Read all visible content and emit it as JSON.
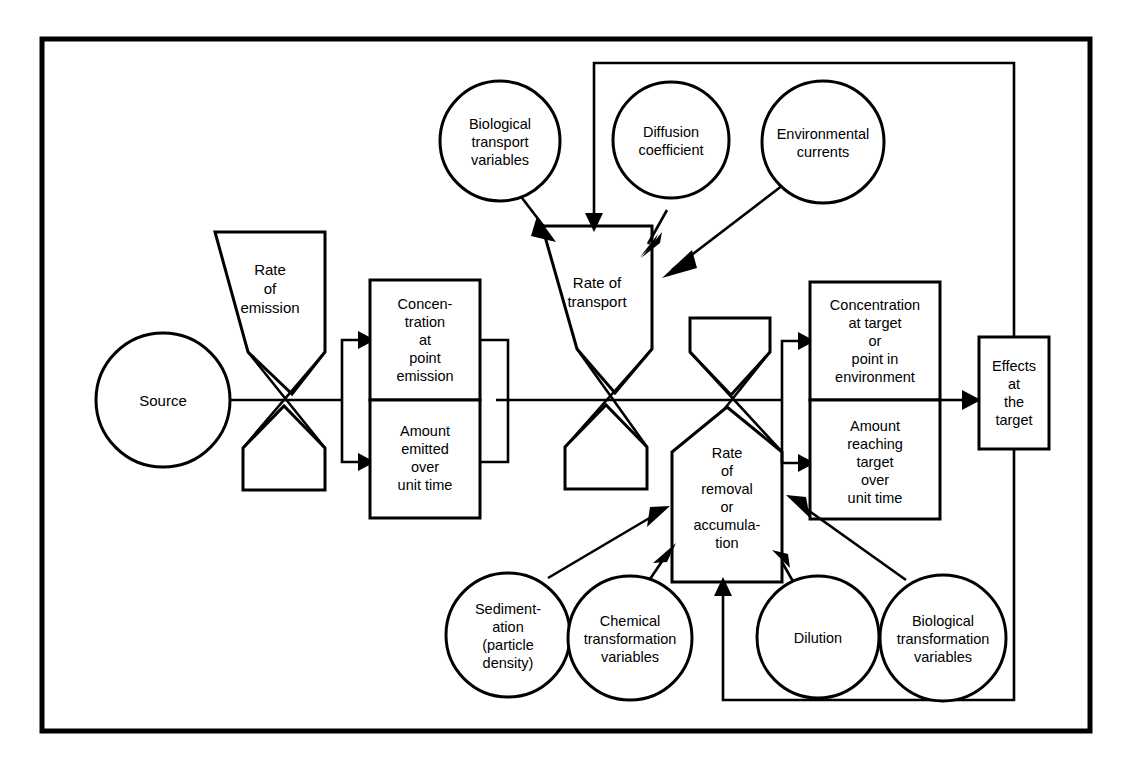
{
  "diagram": {
    "background_color": "#ffffff",
    "line_color": "#000000",
    "frame": {
      "x": 42,
      "y": 39,
      "width": 1048,
      "height": 692
    },
    "nodes": [
      {
        "id": "source",
        "shape": "circle",
        "label": "Source",
        "cx": 163,
        "cy": 400,
        "r": 67
      },
      {
        "id": "rate-of-emission",
        "shape": "pentagon-down",
        "label": "Rate\nof\nemission",
        "x": 215,
        "y": 232,
        "width": 110,
        "height": 162
      },
      {
        "id": "emission-blank",
        "shape": "pentagon-up",
        "label": "",
        "x": 243,
        "y": 406,
        "width": 82,
        "height": 84
      },
      {
        "id": "concentration-point",
        "shape": "rect",
        "label": "Concen-\ntration\nat\npoint\nemission",
        "x": 370,
        "y": 280,
        "width": 110,
        "height": 120
      },
      {
        "id": "amount-emitted",
        "shape": "rect",
        "label": "Amount\nemitted\nover\nunit time",
        "x": 370,
        "y": 400,
        "width": 110,
        "height": 118
      },
      {
        "id": "biological-transport",
        "shape": "circle",
        "label": "Biological\ntransport\nvariables",
        "cx": 500,
        "cy": 141,
        "r": 60
      },
      {
        "id": "diffusion-coefficient",
        "shape": "circle",
        "label": "Diffusion\ncoefficient",
        "cx": 671,
        "cy": 140,
        "r": 58
      },
      {
        "id": "environmental-currents",
        "shape": "circle",
        "label": "Environmental\ncurrents",
        "cx": 823,
        "cy": 142,
        "r": 61
      },
      {
        "id": "rate-of-transport",
        "shape": "pentagon-down",
        "label": "Rate of\ntransport",
        "x": 542,
        "y": 226,
        "width": 110,
        "height": 165
      },
      {
        "id": "transport-blank",
        "shape": "pentagon-up",
        "label": "",
        "x": 565,
        "y": 405,
        "width": 82,
        "height": 84
      },
      {
        "id": "removal-blank",
        "shape": "pentagon-down",
        "label": "",
        "x": 690,
        "y": 318,
        "width": 80,
        "height": 84
      },
      {
        "id": "rate-of-removal",
        "shape": "pentagon-up",
        "label": "Rate\nof\nremoval\nor\naccumula-\ntion",
        "x": 672,
        "y": 407,
        "width": 110,
        "height": 175
      },
      {
        "id": "concentration-target",
        "shape": "rect",
        "label": "Concentration\nat target\nor\npoint in\nenvironment",
        "x": 810,
        "y": 282,
        "width": 130,
        "height": 118
      },
      {
        "id": "amount-reaching",
        "shape": "rect",
        "label": "Amount\nreaching\ntarget\nover\nunit time",
        "x": 810,
        "y": 400,
        "width": 130,
        "height": 119
      },
      {
        "id": "effects-at-target",
        "shape": "rect",
        "label": "Effects\nat\nthe\ntarget",
        "x": 979,
        "y": 337,
        "width": 70,
        "height": 112
      },
      {
        "id": "sedimentation",
        "shape": "circle",
        "label": "Sediment-\nation\n(particle\ndensity)",
        "cx": 508,
        "cy": 635,
        "r": 62
      },
      {
        "id": "chemical-transformation",
        "shape": "circle",
        "label": "Chemical\ntransformation\nvariables",
        "cx": 630,
        "cy": 638,
        "r": 62
      },
      {
        "id": "dilution",
        "shape": "circle",
        "label": "Dilution",
        "cx": 818,
        "cy": 637,
        "r": 61
      },
      {
        "id": "biological-transformation",
        "shape": "circle",
        "label": "Biological\ntransformation\nvariables",
        "cx": 943,
        "cy": 638,
        "r": 63
      }
    ],
    "edges": [
      {
        "id": "source-to-emission-junction",
        "from": "source",
        "to": "emission-bowtie",
        "type": "line"
      },
      {
        "id": "emission-junction-to-split",
        "from": "emission-bowtie",
        "to": "emission-split",
        "type": "line"
      },
      {
        "id": "split-to-concentration-point",
        "from": "emission-split",
        "to": "concentration-point",
        "type": "arrow"
      },
      {
        "id": "split-to-amount-emitted",
        "from": "emission-split",
        "to": "amount-emitted",
        "type": "arrow"
      },
      {
        "id": "emission-merge-to-transport",
        "from": "emission-merge",
        "to": "transport-bowtie",
        "type": "line"
      },
      {
        "id": "biological-transport-to-transport",
        "from": "biological-transport",
        "to": "rate-of-transport",
        "type": "arrow"
      },
      {
        "id": "diffusion-to-transport",
        "from": "diffusion-coefficient",
        "to": "rate-of-transport",
        "type": "arrow"
      },
      {
        "id": "currents-to-transport",
        "from": "environmental-currents",
        "to": "rate-of-transport",
        "type": "arrow"
      },
      {
        "id": "effects-feedback-to-transport",
        "from": "effects-at-target",
        "to": "rate-of-transport",
        "type": "arrow"
      },
      {
        "id": "transport-bowtie-to-removal-bowtie",
        "from": "transport-bowtie",
        "to": "removal-bowtie",
        "type": "line"
      },
      {
        "id": "removal-split-to-concentration-target",
        "from": "removal-split",
        "to": "concentration-target",
        "type": "arrow"
      },
      {
        "id": "removal-split-to-amount-reaching",
        "from": "removal-split",
        "to": "amount-reaching",
        "type": "arrow"
      },
      {
        "id": "target-merge-to-effects",
        "from": "target-merge",
        "to": "effects-at-target",
        "type": "arrow"
      },
      {
        "id": "sedimentation-to-removal",
        "from": "sedimentation",
        "to": "rate-of-removal",
        "type": "arrow"
      },
      {
        "id": "chemical-to-removal",
        "from": "chemical-transformation",
        "to": "rate-of-removal",
        "type": "arrow"
      },
      {
        "id": "dilution-to-removal",
        "from": "dilution",
        "to": "rate-of-removal",
        "type": "arrow"
      },
      {
        "id": "biological-transformation-to-removal",
        "from": "biological-transformation",
        "to": "rate-of-removal",
        "type": "arrow"
      },
      {
        "id": "effects-bottom-feedback-to-removal",
        "from": "effects-at-target",
        "to": "rate-of-removal",
        "type": "arrow"
      }
    ]
  }
}
